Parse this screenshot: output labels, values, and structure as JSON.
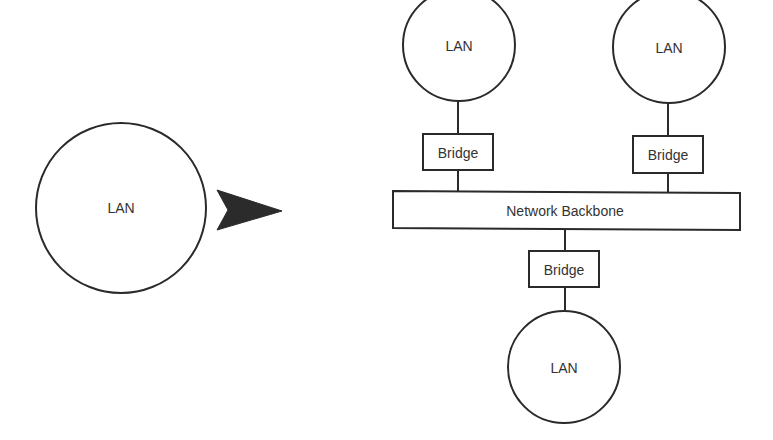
{
  "diagram": {
    "title": "",
    "colors": {
      "stroke": "#2a2a2a",
      "text": "#333333",
      "arrow": "#2b2b2b",
      "background": "#ffffff"
    },
    "nodes": {
      "lan_single": {
        "label": "LAN",
        "shape": "circle"
      },
      "lan_top_left": {
        "label": "LAN",
        "shape": "circle"
      },
      "lan_top_right": {
        "label": "LAN",
        "shape": "circle"
      },
      "lan_bottom": {
        "label": "LAN",
        "shape": "circle"
      },
      "bridge_top_left": {
        "label": "Bridge",
        "shape": "rect"
      },
      "bridge_top_right": {
        "label": "Bridge",
        "shape": "rect"
      },
      "bridge_bottom": {
        "label": "Bridge",
        "shape": "rect"
      },
      "backbone": {
        "label": "Network Backbone",
        "shape": "rect"
      }
    },
    "arrow": {
      "icon": "arrowhead-right-icon",
      "meaning": "transforms into"
    },
    "edges": [
      {
        "from": "lan_top_left",
        "to": "bridge_top_left"
      },
      {
        "from": "bridge_top_left",
        "to": "backbone"
      },
      {
        "from": "lan_top_right",
        "to": "bridge_top_right"
      },
      {
        "from": "bridge_top_right",
        "to": "backbone"
      },
      {
        "from": "backbone",
        "to": "bridge_bottom"
      },
      {
        "from": "bridge_bottom",
        "to": "lan_bottom"
      }
    ]
  }
}
